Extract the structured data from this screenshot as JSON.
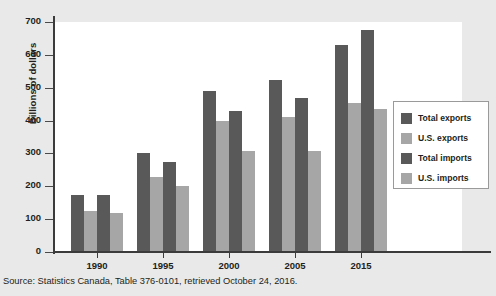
{
  "chart_data": {
    "type": "bar",
    "title": "",
    "xlabel": "",
    "ylabel": "Billions of dollars",
    "ylim": [
      0,
      700
    ],
    "yticks": [
      0,
      100,
      200,
      300,
      400,
      500,
      600,
      700
    ],
    "grid": false,
    "legend_position": "right",
    "categories": [
      "1990",
      "1995",
      "2000",
      "2005",
      "2015"
    ],
    "series": [
      {
        "name": "Total exports",
        "color": "#595959",
        "values": [
          175,
          302,
          490,
          525,
          630
        ]
      },
      {
        "name": "U.S. exports",
        "color": "#a6a6a6",
        "values": [
          125,
          227,
          398,
          412,
          455
        ]
      },
      {
        "name": "Total imports",
        "color": "#595959",
        "values": [
          175,
          275,
          428,
          468,
          675
        ]
      },
      {
        "name": "U.S. imports",
        "color": "#a6a6a6",
        "values": [
          120,
          200,
          308,
          308,
          435
        ]
      }
    ],
    "source": "Source: Statistics Canada, Table 376-0101, retrieved October 24, 2016."
  },
  "legend": {
    "items": [
      {
        "label": "Total exports",
        "color": "#595959"
      },
      {
        "label": "U.S. exports",
        "color": "#a6a6a6"
      },
      {
        "label": "Total imports",
        "color": "#595959"
      },
      {
        "label": "U.S. imports",
        "color": "#a6a6a6"
      }
    ]
  },
  "colors": {
    "background": "#e9e9e9",
    "plot_background": "#ffffff",
    "axis": "#3b3b3b",
    "text": "#231f20",
    "dark_series": "#595959",
    "light_series": "#a6a6a6"
  }
}
